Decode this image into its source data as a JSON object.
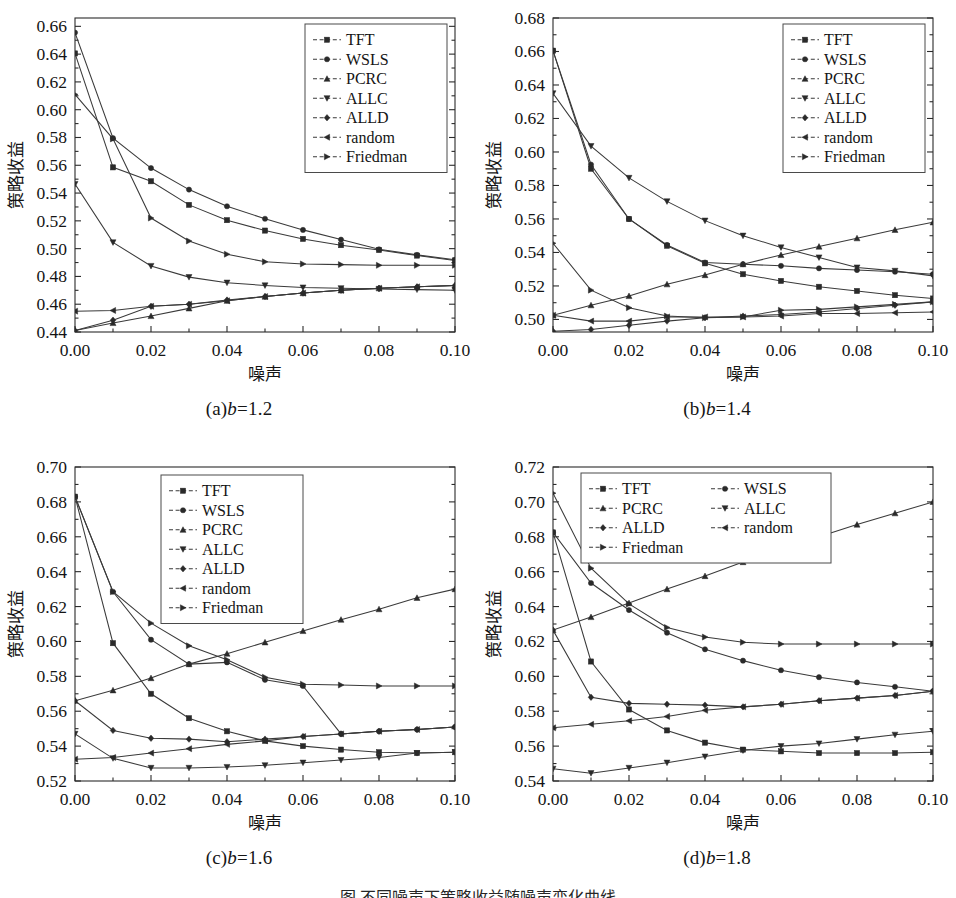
{
  "figure": {
    "caption": "图   不同噪声下策略收益随噪声变化曲线",
    "series_names": [
      "TFT",
      "WSLS",
      "PCRC",
      "ALLC",
      "ALLD",
      "random",
      "Friedman"
    ],
    "marker_shapes": {
      "TFT": "square",
      "WSLS": "circle",
      "PCRC": "triangle-up",
      "ALLC": "triangle-down",
      "ALLD": "diamond",
      "random": "triangle-left",
      "Friedman": "triangle-right"
    },
    "line_color": "#3a3a3a",
    "marker_color": "#2a2a2a",
    "frame_color": "#2b2b2b"
  },
  "chart_data": [
    {
      "type": "line",
      "panel": "a",
      "caption_prefix": "(a)",
      "caption_var": "b",
      "caption_value": "=1.2",
      "title": "(a)b=1.2",
      "xlabel": "噪声",
      "ylabel": "策略收益",
      "x": [
        0.0,
        0.01,
        0.02,
        0.03,
        0.04,
        0.05,
        0.06,
        0.07,
        0.08,
        0.09,
        0.1
      ],
      "xlim": [
        0.0,
        0.1
      ],
      "ylim": [
        0.44,
        0.666
      ],
      "xticks": [
        0.0,
        0.02,
        0.04,
        0.06,
        0.08,
        0.1
      ],
      "xtick_labels": [
        "0.00",
        "0.02",
        "0.04",
        "0.06",
        "0.08",
        "0.10"
      ],
      "yticks": [
        0.44,
        0.46,
        0.48,
        0.5,
        0.52,
        0.54,
        0.56,
        0.58,
        0.6,
        0.62,
        0.64,
        0.66
      ],
      "ytick_labels": [
        "0.44",
        "0.46",
        "0.48",
        "0.50",
        "0.52",
        "0.54",
        "0.56",
        "0.58",
        "0.60",
        "0.62",
        "0.64",
        "0.66"
      ],
      "legend_position": "top-right",
      "legend_columns": 1,
      "grid": false,
      "series": [
        {
          "name": "TFT",
          "values": [
            0.6405,
            0.5585,
            0.5485,
            0.5315,
            0.5205,
            0.513,
            0.507,
            0.5025,
            0.499,
            0.495,
            0.4915
          ]
        },
        {
          "name": "WSLS",
          "values": [
            0.6555,
            0.5795,
            0.558,
            0.5425,
            0.5305,
            0.5215,
            0.5135,
            0.5065,
            0.4995,
            0.4955,
            0.492
          ]
        },
        {
          "name": "PCRC",
          "values": [
            0.441,
            0.4465,
            0.4515,
            0.457,
            0.4625,
            0.4655,
            0.468,
            0.47,
            0.4715,
            0.4725,
            0.4735
          ]
        },
        {
          "name": "ALLC",
          "values": [
            0.5465,
            0.5045,
            0.4875,
            0.4795,
            0.4755,
            0.4735,
            0.472,
            0.4715,
            0.471,
            0.4705,
            0.47
          ]
        },
        {
          "name": "ALLD",
          "values": [
            0.441,
            0.4485,
            0.4585,
            0.46,
            0.463,
            0.4655,
            0.468,
            0.47,
            0.4715,
            0.4725,
            0.4735
          ]
        },
        {
          "name": "random",
          "values": [
            0.455,
            0.4555,
            0.4585,
            0.46,
            0.4625,
            0.4655,
            0.468,
            0.47,
            0.4715,
            0.4725,
            0.4735
          ]
        },
        {
          "name": "Friedman",
          "values": [
            0.611,
            0.579,
            0.522,
            0.5055,
            0.496,
            0.4905,
            0.489,
            0.4885,
            0.488,
            0.488,
            0.488
          ]
        }
      ]
    },
    {
      "type": "line",
      "panel": "b",
      "caption_prefix": "(b)",
      "caption_var": "b",
      "caption_value": "=1.4",
      "title": "(b)b=1.4",
      "xlabel": "噪声",
      "ylabel": "策略收益",
      "x": [
        0.0,
        0.01,
        0.02,
        0.03,
        0.04,
        0.05,
        0.06,
        0.07,
        0.08,
        0.09,
        0.1
      ],
      "xlim": [
        0.0,
        0.1
      ],
      "ylim": [
        0.4925,
        0.68
      ],
      "xticks": [
        0.0,
        0.02,
        0.04,
        0.06,
        0.08,
        0.1
      ],
      "xtick_labels": [
        "0.00",
        "0.02",
        "0.04",
        "0.06",
        "0.08",
        "0.10"
      ],
      "yticks": [
        0.5,
        0.52,
        0.54,
        0.56,
        0.58,
        0.6,
        0.62,
        0.64,
        0.66,
        0.68
      ],
      "ytick_labels": [
        "0.50",
        "0.52",
        "0.54",
        "0.56",
        "0.58",
        "0.60",
        "0.62",
        "0.64",
        "0.66",
        "0.68"
      ],
      "legend_position": "top-right",
      "legend_columns": 1,
      "grid": false,
      "series": [
        {
          "name": "TFT",
          "values": [
            0.6605,
            0.59,
            0.56,
            0.544,
            0.5335,
            0.527,
            0.523,
            0.5195,
            0.517,
            0.5145,
            0.5125
          ]
        },
        {
          "name": "WSLS",
          "values": [
            0.6605,
            0.5925,
            0.56,
            0.5445,
            0.534,
            0.533,
            0.532,
            0.5305,
            0.5295,
            0.5285,
            0.527
          ]
        },
        {
          "name": "PCRC",
          "values": [
            0.5025,
            0.5085,
            0.514,
            0.521,
            0.5265,
            0.533,
            0.5385,
            0.5435,
            0.5485,
            0.5535,
            0.558
          ]
        },
        {
          "name": "ALLC",
          "values": [
            0.635,
            0.6035,
            0.5845,
            0.5705,
            0.559,
            0.55,
            0.543,
            0.537,
            0.531,
            0.529,
            0.526
          ]
        },
        {
          "name": "ALLD",
          "values": [
            0.493,
            0.494,
            0.4965,
            0.499,
            0.501,
            0.502,
            0.503,
            0.5045,
            0.5065,
            0.5085,
            0.5105
          ]
        },
        {
          "name": "random",
          "values": [
            0.5025,
            0.499,
            0.499,
            0.5015,
            0.5015,
            0.5015,
            0.502,
            0.5035,
            0.5035,
            0.504,
            0.5045
          ]
        },
        {
          "name": "Friedman",
          "values": [
            0.5455,
            0.5175,
            0.507,
            0.502,
            0.501,
            0.5015,
            0.5055,
            0.506,
            0.5075,
            0.509,
            0.5105
          ]
        }
      ]
    },
    {
      "type": "line",
      "panel": "c",
      "caption_prefix": "(c)",
      "caption_var": "b",
      "caption_value": "=1.6",
      "title": "(c)b=1.6",
      "xlabel": "噪声",
      "ylabel": "策略收益",
      "x": [
        0.0,
        0.01,
        0.02,
        0.03,
        0.04,
        0.05,
        0.06,
        0.07,
        0.08,
        0.09,
        0.1
      ],
      "xlim": [
        0.0,
        0.1
      ],
      "ylim": [
        0.52,
        0.7
      ],
      "xticks": [
        0.0,
        0.02,
        0.04,
        0.06,
        0.08,
        0.1
      ],
      "xtick_labels": [
        "0.00",
        "0.02",
        "0.04",
        "0.06",
        "0.08",
        "0.10"
      ],
      "yticks": [
        0.52,
        0.54,
        0.56,
        0.58,
        0.6,
        0.62,
        0.64,
        0.66,
        0.68,
        0.7
      ],
      "ytick_labels": [
        "0.52",
        "0.54",
        "0.56",
        "0.58",
        "0.60",
        "0.62",
        "0.64",
        "0.66",
        "0.68",
        "0.70"
      ],
      "legend_position": "top-center",
      "legend_columns": 1,
      "grid": false,
      "series": [
        {
          "name": "TFT",
          "values": [
            0.683,
            0.599,
            0.57,
            0.556,
            0.5485,
            0.543,
            0.54,
            0.538,
            0.5365,
            0.536,
            0.5365
          ]
        },
        {
          "name": "WSLS",
          "values": [
            0.683,
            0.6285,
            0.601,
            0.587,
            0.588,
            0.578,
            0.5745,
            0.547,
            0.5485,
            0.5495,
            0.551
          ]
        },
        {
          "name": "PCRC",
          "values": [
            0.566,
            0.572,
            0.579,
            0.587,
            0.593,
            0.5995,
            0.606,
            0.6125,
            0.6185,
            0.625,
            0.63
          ]
        },
        {
          "name": "ALLC",
          "values": [
            0.547,
            0.533,
            0.5275,
            0.5275,
            0.528,
            0.529,
            0.5305,
            0.532,
            0.5335,
            0.536,
            0.5365
          ]
        },
        {
          "name": "ALLD",
          "values": [
            0.566,
            0.549,
            0.5445,
            0.544,
            0.5425,
            0.544,
            0.5455,
            0.547,
            0.5485,
            0.5495,
            0.551
          ]
        },
        {
          "name": "random",
          "values": [
            0.5325,
            0.5335,
            0.536,
            0.5385,
            0.541,
            0.543,
            0.5455,
            0.547,
            0.5485,
            0.5495,
            0.551
          ]
        },
        {
          "name": "Friedman",
          "values": [
            0.683,
            0.6285,
            0.6105,
            0.5975,
            0.5895,
            0.5795,
            0.5755,
            0.575,
            0.5745,
            0.5745,
            0.5745
          ]
        }
      ]
    },
    {
      "type": "line",
      "panel": "d",
      "caption_prefix": "(d)",
      "caption_var": "b",
      "caption_value": "=1.8",
      "title": "(d)b=1.8",
      "xlabel": "噪声",
      "ylabel": "策略收益",
      "x": [
        0.0,
        0.01,
        0.02,
        0.03,
        0.04,
        0.05,
        0.06,
        0.07,
        0.08,
        0.09,
        0.1
      ],
      "xlim": [
        0.0,
        0.1
      ],
      "ylim": [
        0.54,
        0.72
      ],
      "xticks": [
        0.0,
        0.02,
        0.04,
        0.06,
        0.08,
        0.1
      ],
      "xtick_labels": [
        "0.00",
        "0.02",
        "0.04",
        "0.06",
        "0.08",
        "0.10"
      ],
      "yticks": [
        0.54,
        0.56,
        0.58,
        0.6,
        0.62,
        0.64,
        0.66,
        0.68,
        0.7,
        0.72
      ],
      "ytick_labels": [
        "0.54",
        "0.56",
        "0.58",
        "0.60",
        "0.62",
        "0.64",
        "0.66",
        "0.68",
        "0.70",
        "0.72"
      ],
      "legend_position": "top-left",
      "legend_columns": 2,
      "grid": false,
      "series": [
        {
          "name": "TFT",
          "values": [
            0.6825,
            0.6085,
            0.581,
            0.569,
            0.562,
            0.558,
            0.557,
            0.556,
            0.556,
            0.556,
            0.5565
          ]
        },
        {
          "name": "WSLS",
          "values": [
            0.6825,
            0.6535,
            0.638,
            0.625,
            0.6155,
            0.609,
            0.6035,
            0.5995,
            0.5965,
            0.594,
            0.5915
          ]
        },
        {
          "name": "PCRC",
          "values": [
            0.6265,
            0.634,
            0.642,
            0.65,
            0.6575,
            0.6655,
            0.673,
            0.68,
            0.687,
            0.6935,
            0.7
          ]
        },
        {
          "name": "ALLC",
          "values": [
            0.547,
            0.5445,
            0.5475,
            0.5505,
            0.554,
            0.5575,
            0.56,
            0.5615,
            0.564,
            0.5665,
            0.5685
          ]
        },
        {
          "name": "ALLD",
          "values": [
            0.6265,
            0.588,
            0.5845,
            0.584,
            0.5835,
            0.5825,
            0.584,
            0.586,
            0.5875,
            0.589,
            0.5915
          ]
        },
        {
          "name": "random",
          "values": [
            0.5705,
            0.5725,
            0.5745,
            0.577,
            0.5805,
            0.5825,
            0.584,
            0.586,
            0.5875,
            0.589,
            0.5915
          ]
        },
        {
          "name": "Friedman",
          "values": [
            0.705,
            0.662,
            0.6415,
            0.628,
            0.6225,
            0.6195,
            0.6185,
            0.6185,
            0.6185,
            0.6185,
            0.6185
          ]
        }
      ]
    }
  ]
}
